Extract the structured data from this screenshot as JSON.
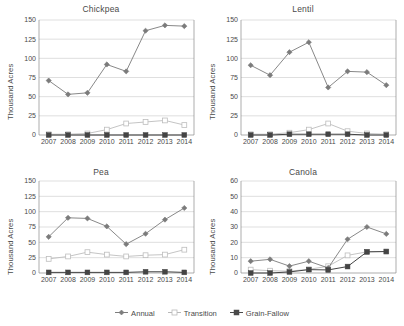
{
  "figure": {
    "ylabel": "Thousand Acres",
    "x_categories": [
      "2007",
      "2008",
      "2009",
      "2010",
      "2011",
      "2012",
      "2013",
      "2014"
    ],
    "legend": [
      {
        "name": "Annual",
        "marker": "diamond",
        "color": "#7d7d7d"
      },
      {
        "name": "Transition",
        "marker": "open-square",
        "color": "#b9b9b9"
      },
      {
        "name": "Grain-Fallow",
        "marker": "filled-square",
        "color": "#4a4a4a"
      }
    ]
  },
  "chart_data": [
    {
      "type": "line",
      "title": "Chickpea",
      "xlabel": "",
      "ylabel": "Thousand Acres",
      "x": [
        "2007",
        "2008",
        "2009",
        "2010",
        "2011",
        "2012",
        "2013",
        "2014"
      ],
      "ylim": [
        0,
        150
      ],
      "yticks": [
        0,
        25,
        50,
        75,
        100,
        125,
        150
      ],
      "grid": true,
      "legend_position": "bottom",
      "series": [
        {
          "name": "Annual",
          "values": [
            71,
            53,
            55,
            92,
            83,
            136,
            143,
            142
          ]
        },
        {
          "name": "Transition",
          "values": [
            1,
            1,
            2,
            7,
            15,
            17,
            19,
            13
          ]
        },
        {
          "name": "Grain-Fallow",
          "values": [
            0,
            0,
            0,
            0,
            0,
            0,
            0,
            0
          ]
        }
      ]
    },
    {
      "type": "line",
      "title": "Lentil",
      "xlabel": "",
      "ylabel": "Thousand Acres",
      "x": [
        "2007",
        "2008",
        "2009",
        "2010",
        "2011",
        "2012",
        "2013",
        "2014"
      ],
      "ylim": [
        0,
        150
      ],
      "yticks": [
        0,
        25,
        50,
        75,
        100,
        125,
        150
      ],
      "grid": true,
      "legend_position": "bottom",
      "series": [
        {
          "name": "Annual",
          "values": [
            91,
            78,
            108,
            121,
            62,
            83,
            82,
            65
          ]
        },
        {
          "name": "Transition",
          "values": [
            1,
            1,
            3,
            7,
            15,
            5,
            2,
            1
          ]
        },
        {
          "name": "Grain-Fallow",
          "values": [
            0,
            0,
            1,
            1,
            1,
            1,
            0,
            0
          ]
        }
      ]
    },
    {
      "type": "line",
      "title": "Pea",
      "xlabel": "",
      "ylabel": "Thousand Acres",
      "x": [
        "2007",
        "2008",
        "2009",
        "2010",
        "2011",
        "2012",
        "2013",
        "2014"
      ],
      "ylim": [
        0,
        150
      ],
      "yticks": [
        0,
        25,
        50,
        75,
        100,
        125,
        150
      ],
      "grid": true,
      "legend_position": "bottom",
      "series": [
        {
          "name": "Annual",
          "values": [
            59,
            90,
            89,
            76,
            47,
            64,
            87,
            106
          ]
        },
        {
          "name": "Transition",
          "values": [
            23,
            27,
            34,
            30,
            27,
            29,
            30,
            38
          ]
        },
        {
          "name": "Grain-Fallow",
          "values": [
            1,
            1,
            1,
            1,
            1,
            2,
            2,
            1
          ]
        }
      ]
    },
    {
      "type": "line",
      "title": "Canola",
      "xlabel": "",
      "ylabel": "Thousand Acres",
      "x": [
        "2007",
        "2008",
        "2009",
        "2010",
        "2011",
        "2012",
        "2013",
        "2014"
      ],
      "ylim": [
        0,
        60
      ],
      "yticks": [
        0,
        10,
        20,
        30,
        40,
        50,
        60
      ],
      "grid": true,
      "legend_position": "bottom",
      "series": [
        {
          "name": "Annual",
          "values": [
            7.7,
            8.9,
            4.5,
            7.7,
            3.3,
            22,
            30,
            25.5
          ]
        },
        {
          "name": "Transition",
          "values": [
            2.2,
            1.5,
            1.2,
            2.4,
            4.4,
            11.5,
            13.8,
            14
          ]
        },
        {
          "name": "Grain-Fallow",
          "values": [
            0,
            0,
            0.7,
            2.2,
            2,
            4.2,
            13.8,
            14
          ]
        }
      ]
    }
  ]
}
